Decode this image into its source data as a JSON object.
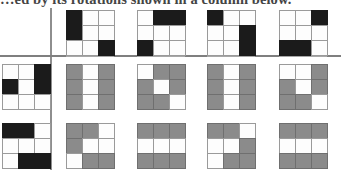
{
  "caption": {
    "text": "…ed by its rotations shown in a column below."
  },
  "colors": {
    "black_tile": "#1b1b1b",
    "gray_tile": "#8b8b8b",
    "empty_tile": "#fdfdfd",
    "grid_line": "#9a9a9a",
    "rule_line": "#8e8e8e",
    "page_background": "#ffffff"
  },
  "figure": {
    "rules": {
      "vertical_divider": "vertical-rule",
      "horizontal_divider": "horizontal-rule"
    },
    "top_row": {
      "name": "top-header-row",
      "fill": "black",
      "grids": [
        {
          "name": "top-grid-1",
          "cells": [
            1,
            0,
            0,
            1,
            0,
            0,
            0,
            0,
            1
          ]
        },
        {
          "name": "top-grid-2",
          "cells": [
            0,
            1,
            1,
            0,
            0,
            0,
            1,
            0,
            0
          ]
        },
        {
          "name": "top-grid-3",
          "cells": [
            1,
            0,
            0,
            0,
            0,
            1,
            0,
            0,
            1
          ]
        },
        {
          "name": "top-grid-4",
          "cells": [
            0,
            0,
            1,
            0,
            0,
            0,
            1,
            1,
            0
          ]
        }
      ]
    },
    "key_column": {
      "name": "left-key-column",
      "fill": "black",
      "grids": [
        {
          "name": "key-grid-row2",
          "cells": [
            0,
            0,
            1,
            1,
            0,
            1,
            0,
            0,
            0
          ]
        },
        {
          "name": "key-grid-row3",
          "cells": [
            1,
            1,
            0,
            0,
            0,
            0,
            0,
            1,
            1
          ]
        }
      ]
    },
    "body_rows": [
      {
        "name": "body-row-2",
        "fill": "gray",
        "grids": [
          {
            "name": "body-grid-r2c1",
            "cells": [
              1,
              0,
              1,
              1,
              0,
              1,
              1,
              0,
              1
            ]
          },
          {
            "name": "body-grid-r2c2",
            "cells": [
              0,
              1,
              1,
              1,
              0,
              1,
              1,
              1,
              0
            ]
          },
          {
            "name": "body-grid-r2c3",
            "cells": [
              1,
              0,
              1,
              1,
              0,
              1,
              1,
              0,
              1
            ]
          },
          {
            "name": "body-grid-r2c4",
            "cells": [
              0,
              0,
              1,
              1,
              0,
              1,
              1,
              1,
              0
            ]
          }
        ]
      },
      {
        "name": "body-row-3",
        "fill": "gray",
        "grids": [
          {
            "name": "body-grid-r3c1",
            "cells": [
              1,
              1,
              0,
              1,
              0,
              0,
              0,
              1,
              1
            ]
          },
          {
            "name": "body-grid-r3c2",
            "cells": [
              1,
              1,
              1,
              0,
              0,
              0,
              1,
              1,
              1
            ]
          },
          {
            "name": "body-grid-r3c3",
            "cells": [
              1,
              1,
              0,
              0,
              0,
              1,
              0,
              1,
              1
            ]
          },
          {
            "name": "body-grid-r3c4",
            "cells": [
              1,
              1,
              1,
              0,
              0,
              0,
              1,
              1,
              1
            ]
          }
        ]
      }
    ]
  }
}
